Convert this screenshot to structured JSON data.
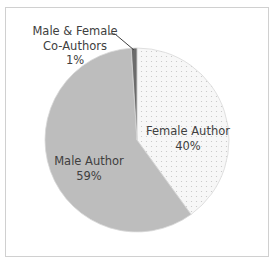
{
  "chart_data": {
    "type": "pie",
    "title": "",
    "start_angle_deg": 0,
    "direction": "clockwise",
    "slices": [
      {
        "label": "Female Author",
        "value": 40,
        "value_label": "40%",
        "color": "#f4f4f4",
        "pattern": "dotted"
      },
      {
        "label": "Male Author",
        "value": 59,
        "value_label": "59%",
        "color": "#bdbdbd",
        "pattern": "solid"
      },
      {
        "label": "Male & Female Co-Authors",
        "value": 1,
        "value_label": "1%",
        "color": "#6b6b6b",
        "pattern": "solid"
      }
    ],
    "legend": "none",
    "labels": {
      "female": {
        "line1": "Female Author",
        "line2": "40%"
      },
      "male": {
        "line1": "Male Author",
        "line2": "59%"
      },
      "co": {
        "line1": "Male & Female",
        "line2": "Co-Authors",
        "line3": "1%"
      }
    }
  }
}
